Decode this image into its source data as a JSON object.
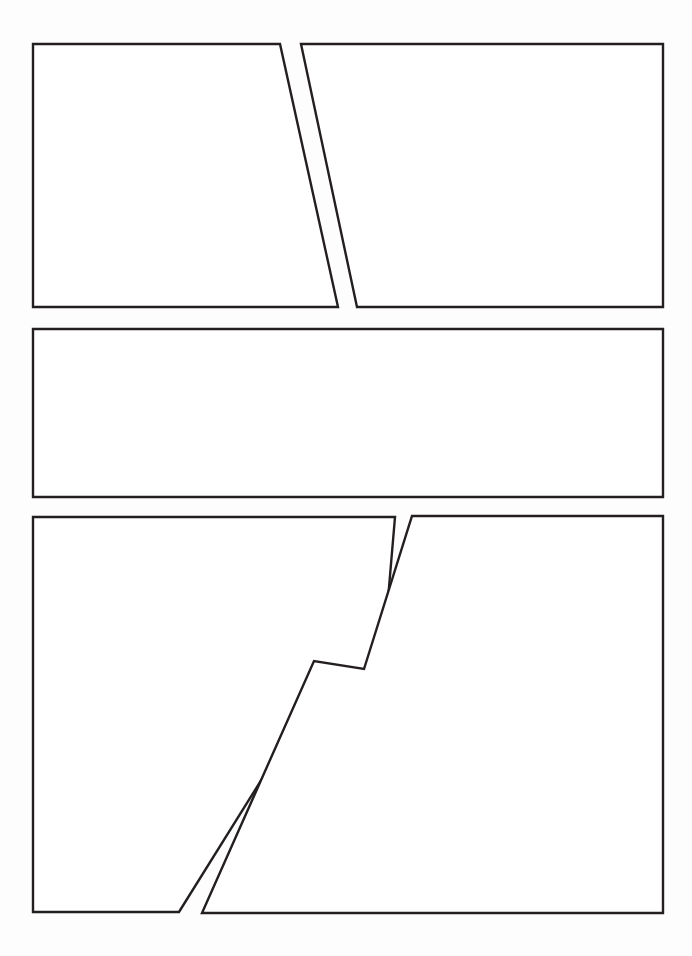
{
  "page": {
    "title": "Comic Page Layout Template",
    "width": 692,
    "height": 956,
    "background_color": "#fdfdfd",
    "paper_color": "#ffffff",
    "border_color": "#231f20",
    "border_width": 2.4,
    "panel_count": 5,
    "row_count": 3
  },
  "rows": [
    {
      "name": "row-1",
      "label": "Top row",
      "panel_count": 2,
      "top": 44,
      "bottom": 307
    },
    {
      "name": "row-2",
      "label": "Middle row",
      "panel_count": 1,
      "top": 329,
      "bottom": 497
    },
    {
      "name": "row-3",
      "label": "Bottom row",
      "panel_count": 2,
      "top": 516,
      "bottom": 913
    }
  ],
  "panels": [
    {
      "id": "panel-1",
      "label": "Panel 1",
      "row": "row-1",
      "position": "left",
      "shape": "trapezoid",
      "points": "33,44 280,44 338,307 33,307",
      "fill": "#ffffff",
      "stroke": "#231f20",
      "stroke_width": 2.4
    },
    {
      "id": "panel-2",
      "label": "Panel 2",
      "row": "row-1",
      "position": "right",
      "shape": "trapezoid",
      "points": "301,44 663,44 663,307 357,307",
      "fill": "#ffffff",
      "stroke": "#231f20",
      "stroke_width": 2.4
    },
    {
      "id": "panel-3",
      "label": "Panel 3",
      "row": "row-2",
      "position": "full-width",
      "shape": "rectangle",
      "points": "33,329 663,329 663,497 33,497",
      "fill": "#ffffff",
      "stroke": "#231f20",
      "stroke_width": 2.4
    },
    {
      "id": "panel-4",
      "label": "Panel 4",
      "row": "row-3",
      "position": "left",
      "shape": "zigzag-polygon",
      "points": "33,517 395,517 380,693 323,681 179,912 33,912",
      "fill": "#ffffff",
      "stroke": "#231f20",
      "stroke_width": 2.4
    },
    {
      "id": "panel-5",
      "label": "Panel 5",
      "row": "row-3",
      "position": "right",
      "shape": "zigzag-polygon",
      "points": "412,516 663,516 663,913 202,913 314,661 364,669",
      "fill": "#ffffff",
      "stroke": "#231f20",
      "stroke_width": 2.4
    }
  ],
  "gutters": [
    {
      "id": "gutter-1",
      "label": "Diagonal gutter between Panel 1 and Panel 2",
      "orientation": "diagonal"
    },
    {
      "id": "gutter-2",
      "label": "Horizontal gutter between row 1 and row 2",
      "orientation": "horizontal"
    },
    {
      "id": "gutter-3",
      "label": "Horizontal gutter between row 2 and row 3",
      "orientation": "horizontal"
    },
    {
      "id": "gutter-4",
      "label": "Zigzag gutter between Panel 4 and Panel 5",
      "orientation": "zigzag"
    }
  ]
}
